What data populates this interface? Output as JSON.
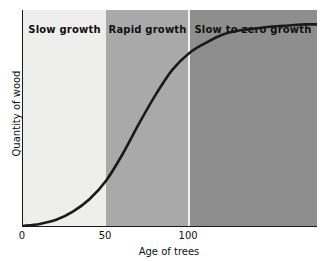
{
  "chart_data": {
    "type": "line",
    "title": "",
    "subtitle": "",
    "xlabel": "Age of trees",
    "ylabel": "Quantity of wood",
    "xlim": [
      0,
      177
    ],
    "ylim": [
      0,
      1.05
    ],
    "xticks": [
      0,
      50,
      100
    ],
    "xticklabels": [
      "0",
      "50",
      "100"
    ],
    "yticks": [],
    "yticklabels": [],
    "grid": false,
    "legend": null,
    "series": [
      {
        "name": "Quantity of wood",
        "x": [
          0,
          10,
          20,
          30,
          40,
          50,
          60,
          70,
          80,
          90,
          100,
          110,
          120,
          130,
          140,
          150,
          160,
          170,
          177
        ],
        "y": [
          0.0,
          0.01,
          0.03,
          0.07,
          0.13,
          0.22,
          0.35,
          0.5,
          0.64,
          0.76,
          0.84,
          0.89,
          0.93,
          0.95,
          0.96,
          0.97,
          0.975,
          0.98,
          0.98
        ]
      }
    ],
    "annotations": [
      {
        "label": "Slow growth",
        "x_range": [
          0,
          50
        ],
        "fill": "#eeeeec"
      },
      {
        "label": "Rapid growth",
        "x_range": [
          50,
          100
        ],
        "fill": "#a9a9a9"
      },
      {
        "label": "Slow to zero growth",
        "x_range": [
          100,
          177
        ],
        "fill": "#8e8e8e"
      }
    ],
    "curve_color": "#1a1a1a",
    "axis_color": "#1a1a1a",
    "background": "#ffffff"
  },
  "axes": {
    "x_title": "Age of trees",
    "y_title": "Quantity of wood",
    "ticks": [
      {
        "label": "0",
        "value": 0
      },
      {
        "label": "50",
        "value": 50
      },
      {
        "label": "100",
        "value": 100
      }
    ]
  },
  "bands": [
    {
      "label": "Slow growth"
    },
    {
      "label": "Rapid growth"
    },
    {
      "label": "Slow to zero growth"
    }
  ]
}
